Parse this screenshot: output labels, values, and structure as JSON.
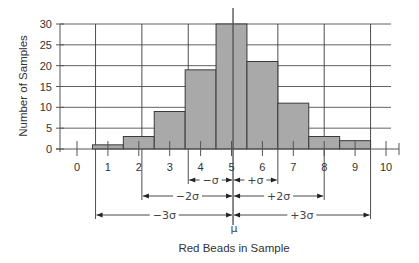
{
  "chart_data": {
    "type": "bar",
    "subtype": "histogram",
    "title": "",
    "xlabel": "Red Beads in Sample",
    "ylabel": "Number of Samples",
    "categories": [
      "1",
      "2",
      "3",
      "4",
      "5",
      "6",
      "7",
      "8",
      "9"
    ],
    "x": [
      1,
      2,
      3,
      4,
      5,
      6,
      7,
      8,
      9
    ],
    "values": [
      1,
      3,
      9,
      19,
      30,
      21,
      11,
      3,
      2
    ],
    "bar_width": 1,
    "xlim": [
      0,
      10
    ],
    "ylim": [
      0,
      30
    ],
    "x_ticks": [
      0,
      1,
      2,
      3,
      4,
      5,
      6,
      7,
      8,
      9,
      10
    ],
    "y_ticks": [
      0,
      5,
      10,
      15,
      20,
      25,
      30
    ],
    "grid": true,
    "legend": null,
    "mean_label": "μ",
    "mean": 5.05,
    "sigma_lines": {
      "minus_3sigma": 0.6,
      "minus_2sigma": 2.1,
      "minus_1sigma": 3.6,
      "mean": 5.05,
      "plus_1sigma": 6.5,
      "plus_2sigma": 8.0,
      "plus_3sigma": 9.5
    },
    "annotations": [
      {
        "label": "−σ",
        "from": "minus_1sigma",
        "to": "mean",
        "row": 1
      },
      {
        "label": "+σ",
        "from": "mean",
        "to": "plus_1sigma",
        "row": 1
      },
      {
        "label": "−2σ",
        "from": "minus_2sigma",
        "to": "mean",
        "row": 2
      },
      {
        "label": "+2σ",
        "from": "mean",
        "to": "plus_2sigma",
        "row": 2
      },
      {
        "label": "−3σ",
        "from": "minus_3sigma",
        "to": "mean",
        "row": 3
      },
      {
        "label": "+3σ",
        "from": "mean",
        "to": "plus_3sigma",
        "row": 3
      }
    ],
    "colors": {
      "bar_fill": "#a9a9a9",
      "bar_stroke": "#3a3a3a",
      "grid": "#3a3a3a",
      "text": "#333333"
    }
  }
}
